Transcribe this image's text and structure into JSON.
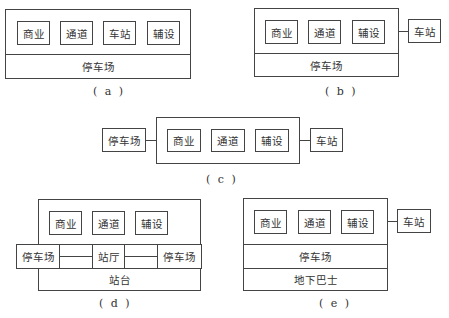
{
  "diagrams": {
    "a": {
      "caption": "( a )",
      "inner": [
        "商业",
        "通道",
        "车站",
        "辅设"
      ],
      "bottom": "停车场"
    },
    "b": {
      "caption": "( b )",
      "inner": [
        "商业",
        "通道",
        "辅设"
      ],
      "bottom": "停车场",
      "external": "车站"
    },
    "c": {
      "caption": "( c )",
      "inner": [
        "商业",
        "通道",
        "辅设"
      ],
      "left_external": "停车场",
      "right_external": "车站"
    },
    "d": {
      "caption": "( d )",
      "inner": [
        "商业",
        "通道",
        "辅设"
      ],
      "row": [
        "停车场",
        "站厅",
        "停车场"
      ],
      "bottom": "站台"
    },
    "e": {
      "caption": "( e )",
      "inner": [
        "商业",
        "通道",
        "辅设"
      ],
      "middle": "停车场",
      "bottom": "地下巴士",
      "external": "车站"
    }
  }
}
